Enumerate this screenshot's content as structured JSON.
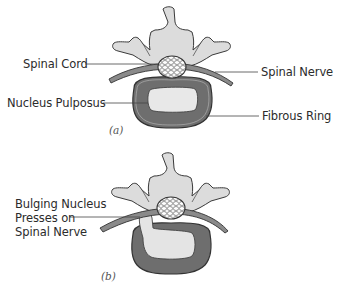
{
  "figure_a": {
    "caption": "(a)",
    "labels": {
      "spinal_cord": "Spinal Cord",
      "spinal_nerve": "Spinal Nerve",
      "nucleus_pulposus": "Nucleus Pulposus",
      "fibrous_ring": "Fibrous Ring"
    }
  },
  "figure_b": {
    "caption": "(b)",
    "labels": {
      "bulging_line1": "Bulging Nucleus",
      "bulging_line2": "Presses on",
      "bulging_line3": "Spinal Nerve"
    }
  },
  "colors": {
    "bone": "#dcdcdc",
    "outline": "#3a3a3a",
    "ring": "#707070",
    "nucleus": "#e8e8e8",
    "nerve": "#8a8a8a"
  }
}
